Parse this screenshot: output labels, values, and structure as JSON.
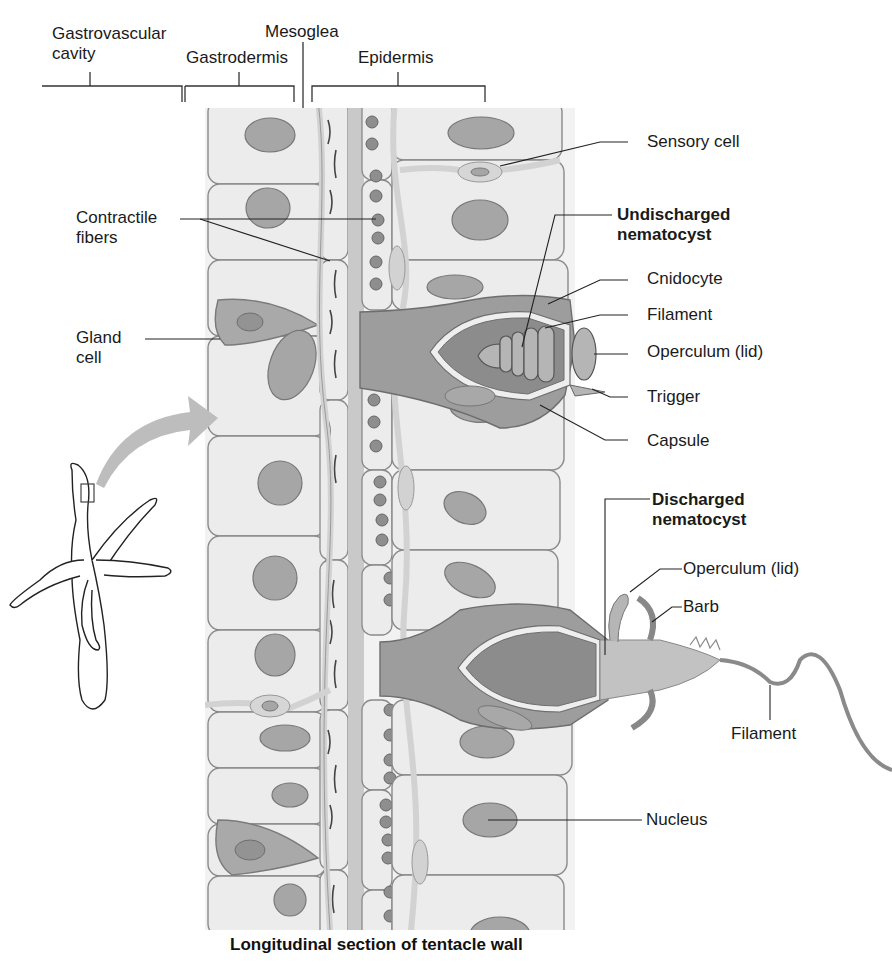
{
  "diagram": {
    "caption": "Longitudinal section of tentacle wall",
    "layer_labels": {
      "gastrovascular_line1": "Gastrovascular",
      "gastrovascular_line2": "cavity",
      "gastrodermis": "Gastrodermis",
      "mesoglea": "Mesoglea",
      "epidermis": "Epidermis"
    },
    "left_labels": {
      "contractile_line1": "Contractile",
      "contractile_line2": "fibers",
      "gland_line1": "Gland",
      "gland_line2": "cell"
    },
    "undischarged": {
      "title_line1": "Undischarged",
      "title_line2": "nematocyst",
      "parts": [
        "Cnidocyte",
        "Filament",
        "Operculum (lid)",
        "Trigger",
        "Capsule"
      ]
    },
    "sensory_cell": "Sensory cell",
    "discharged": {
      "title_line1": "Discharged",
      "title_line2": "nematocyst",
      "parts": [
        "Operculum (lid)",
        "Barb",
        "Filament"
      ]
    },
    "nucleus": "Nucleus",
    "colors": {
      "cell_fill": "#ececec",
      "cell_stroke": "#8a8a8a",
      "nucleus_fill": "#a6a6a6",
      "mesoglea_fill": "#c9c9c9",
      "cnidocyte_fill": "#9d9d9d",
      "capsule_fill": "#8c8c8c",
      "arrow_fill": "#bdbdbd",
      "leader_line": "#222222"
    }
  }
}
